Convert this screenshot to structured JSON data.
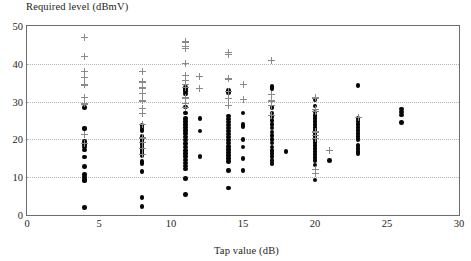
{
  "chart_data": {
    "type": "scatter",
    "title": "",
    "xlabel": "Tap value (dB)",
    "ylabel": "Required level (dBmV)",
    "xlim": [
      0,
      30
    ],
    "ylim": [
      0,
      50
    ],
    "xticks": [
      0,
      5,
      10,
      15,
      20,
      25,
      30
    ],
    "yticks": [
      0,
      10,
      20,
      30,
      40,
      50
    ],
    "xtick_labels": [
      "0",
      "5",
      "10",
      "15",
      "20",
      "25",
      "30"
    ],
    "ytick_labels": [
      "0",
      "10",
      "20",
      "30",
      "40",
      "50"
    ],
    "grid": "horizontal-dotted",
    "legend": "none",
    "marker_colors": {
      "dot": "#060606",
      "plus": "#8a8a8a"
    },
    "frame_color": "#6d6d6d",
    "series": [
      {
        "name": "measured",
        "marker": "filled-circle",
        "points": [
          [
            4,
            28.4
          ],
          [
            4,
            23.0
          ],
          [
            4,
            22.8
          ],
          [
            4,
            19.4
          ],
          [
            4,
            18.7
          ],
          [
            4,
            18.0
          ],
          [
            4,
            17.2
          ],
          [
            4,
            15.3
          ],
          [
            4,
            12.8
          ],
          [
            4,
            10.7
          ],
          [
            4,
            10.1
          ],
          [
            4,
            9.4
          ],
          [
            4,
            9.0
          ],
          [
            4,
            2.0
          ],
          [
            8,
            23.6
          ],
          [
            8,
            23.0
          ],
          [
            8,
            22.4
          ],
          [
            8,
            20.7
          ],
          [
            8,
            20.0
          ],
          [
            8,
            19.4
          ],
          [
            8,
            18.6
          ],
          [
            8,
            18.0
          ],
          [
            8,
            17.4
          ],
          [
            8,
            16.8
          ],
          [
            8,
            16.2
          ],
          [
            8,
            15.6
          ],
          [
            8,
            14.2
          ],
          [
            8,
            13.6
          ],
          [
            8,
            11.5
          ],
          [
            8,
            4.7
          ],
          [
            8,
            2.3
          ],
          [
            11,
            33.8
          ],
          [
            11,
            33.2
          ],
          [
            11,
            32.6
          ],
          [
            11,
            32.0
          ],
          [
            11,
            28.6
          ],
          [
            11,
            27.0
          ],
          [
            11,
            25.6
          ],
          [
            11,
            24.8
          ],
          [
            11,
            24.0
          ],
          [
            11,
            23.2
          ],
          [
            11,
            22.3
          ],
          [
            11,
            21.5
          ],
          [
            11,
            20.6
          ],
          [
            11,
            19.8
          ],
          [
            11,
            18.9
          ],
          [
            11,
            18.0
          ],
          [
            11,
            17.1
          ],
          [
            11,
            16.2
          ],
          [
            11,
            15.4
          ],
          [
            11,
            14.6
          ],
          [
            11,
            13.8
          ],
          [
            11,
            13.0
          ],
          [
            11,
            12.2
          ],
          [
            11,
            9.6
          ],
          [
            11,
            5.5
          ],
          [
            12,
            25.6
          ],
          [
            12,
            22.2
          ],
          [
            12,
            15.5
          ],
          [
            14,
            33.0
          ],
          [
            14,
            32.4
          ],
          [
            14,
            26.2
          ],
          [
            14,
            25.4
          ],
          [
            14,
            24.6
          ],
          [
            14,
            23.8
          ],
          [
            14,
            23.0
          ],
          [
            14,
            22.2
          ],
          [
            14,
            21.4
          ],
          [
            14,
            20.6
          ],
          [
            14,
            19.8
          ],
          [
            14,
            19.0
          ],
          [
            14,
            18.2
          ],
          [
            14,
            17.4
          ],
          [
            14,
            16.6
          ],
          [
            14,
            15.8
          ],
          [
            14,
            15.0
          ],
          [
            14,
            14.2
          ],
          [
            14,
            11.7
          ],
          [
            14,
            7.1
          ],
          [
            15,
            27.0
          ],
          [
            15,
            24.0
          ],
          [
            15,
            23.4
          ],
          [
            15,
            20.0
          ],
          [
            15,
            18.0
          ],
          [
            15,
            14.9
          ],
          [
            15,
            11.7
          ],
          [
            17,
            34.0
          ],
          [
            17,
            33.4
          ],
          [
            17,
            28.4
          ],
          [
            17,
            27.0
          ],
          [
            17,
            26.0
          ],
          [
            17,
            25.0
          ],
          [
            17,
            24.0
          ],
          [
            17,
            23.0
          ],
          [
            17,
            22.0
          ],
          [
            17,
            21.0
          ],
          [
            17,
            20.0
          ],
          [
            17,
            19.0
          ],
          [
            17,
            18.0
          ],
          [
            17,
            17.0
          ],
          [
            17,
            16.2
          ],
          [
            17,
            15.4
          ],
          [
            17,
            14.4
          ],
          [
            17,
            13.6
          ],
          [
            18,
            16.8
          ],
          [
            20,
            30.4
          ],
          [
            20,
            28.8
          ],
          [
            20,
            27.2
          ],
          [
            20,
            26.4
          ],
          [
            20,
            25.6
          ],
          [
            20,
            24.8
          ],
          [
            20,
            24.0
          ],
          [
            20,
            23.2
          ],
          [
            20,
            22.4
          ],
          [
            20,
            21.6
          ],
          [
            20,
            20.8
          ],
          [
            20,
            20.0
          ],
          [
            20,
            19.2
          ],
          [
            20,
            18.4
          ],
          [
            20,
            17.6
          ],
          [
            20,
            16.8
          ],
          [
            20,
            16.0
          ],
          [
            20,
            15.2
          ],
          [
            20,
            14.4
          ],
          [
            20,
            13.2
          ],
          [
            20,
            9.3
          ],
          [
            21,
            14.4
          ],
          [
            23,
            34.3
          ],
          [
            23,
            25.6
          ],
          [
            23,
            24.8
          ],
          [
            23,
            24.0
          ],
          [
            23,
            23.2
          ],
          [
            23,
            22.4
          ],
          [
            23,
            21.6
          ],
          [
            23,
            20.8
          ],
          [
            23,
            20.0
          ],
          [
            23,
            18.4
          ],
          [
            23,
            17.6
          ],
          [
            23,
            16.8
          ],
          [
            23,
            16.2
          ],
          [
            26,
            28.0
          ],
          [
            26,
            27.3
          ],
          [
            26,
            26.5
          ],
          [
            26,
            24.4
          ]
        ]
      },
      {
        "name": "computed",
        "marker": "plus",
        "points": [
          [
            4,
            47.0
          ],
          [
            4,
            42.0
          ],
          [
            4,
            38.0
          ],
          [
            4,
            36.3
          ],
          [
            4,
            34.4
          ],
          [
            4,
            31.2
          ],
          [
            4,
            29.4
          ],
          [
            4,
            21.3
          ],
          [
            4,
            19.0
          ],
          [
            8,
            38.0
          ],
          [
            8,
            35.2
          ],
          [
            8,
            33.6
          ],
          [
            8,
            32.2
          ],
          [
            8,
            30.4
          ],
          [
            8,
            30.2
          ],
          [
            8,
            28.2
          ],
          [
            8,
            26.8
          ],
          [
            8,
            24.0
          ],
          [
            8,
            20.4
          ],
          [
            8,
            19.2
          ],
          [
            8,
            17.6
          ],
          [
            8,
            16.0
          ],
          [
            11,
            45.8
          ],
          [
            11,
            44.6
          ],
          [
            11,
            44.0
          ],
          [
            11,
            40.0
          ],
          [
            11,
            37.0
          ],
          [
            11,
            35.6
          ],
          [
            11,
            34.6
          ],
          [
            11,
            33.8
          ],
          [
            11,
            31.0
          ],
          [
            11,
            29.6
          ],
          [
            11,
            28.4
          ],
          [
            12,
            36.6
          ],
          [
            12,
            33.5
          ],
          [
            14,
            43.0
          ],
          [
            14,
            42.4
          ],
          [
            14,
            36.0
          ],
          [
            14,
            32.8
          ],
          [
            14,
            30.8
          ],
          [
            14,
            29.0
          ],
          [
            15,
            34.6
          ],
          [
            15,
            30.6
          ],
          [
            17,
            41.0
          ],
          [
            17,
            32.0
          ],
          [
            17,
            30.2
          ],
          [
            17,
            29.0
          ],
          [
            17,
            26.4
          ],
          [
            20,
            31.0
          ],
          [
            20,
            28.0
          ],
          [
            20,
            27.4
          ],
          [
            20,
            22.0
          ],
          [
            20,
            21.0
          ],
          [
            20,
            20.2
          ],
          [
            20,
            12.0
          ],
          [
            20,
            11.0
          ],
          [
            21,
            17.0
          ],
          [
            23,
            25.8
          ]
        ]
      }
    ]
  }
}
